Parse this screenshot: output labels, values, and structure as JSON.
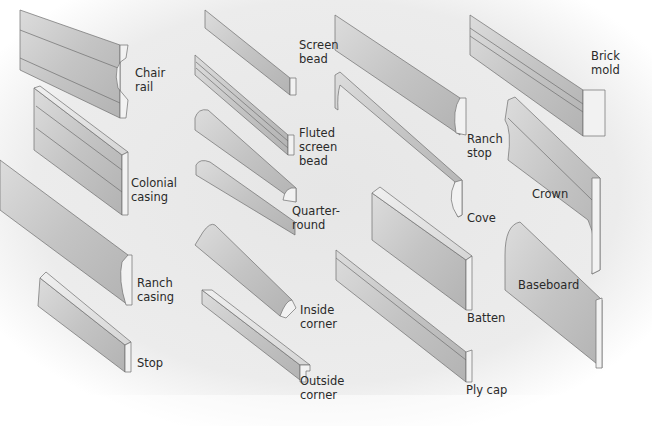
{
  "colors": {
    "background": "#ececec",
    "molding_face": "#c9c9c9",
    "molding_dark": "#a9a9a9",
    "molding_light": "#e8e8e8",
    "profile_end": "#f2f2f2",
    "outline": "#6e6e6e",
    "label_text": "#2a2a2a"
  },
  "labels": {
    "chair_rail": "Chair\nrail",
    "colonial_casing": "Colonial\ncasing",
    "ranch_casing": "Ranch\ncasing",
    "stop": "Stop",
    "screen_bead": "Screen\nbead",
    "fluted_screen_bead": "Fluted\nscreen\nbead",
    "quarter_round": "Quarter-\nround",
    "inside_corner": "Inside\ncorner",
    "outside_corner": "Outside\ncorner",
    "ranch_stop": "Ranch\nstop",
    "cove": "Cove",
    "batten": "Batten",
    "ply_cap": "Ply cap",
    "brick_mold": "Brick\nmold",
    "crown": "Crown",
    "baseboard": "Baseboard"
  }
}
